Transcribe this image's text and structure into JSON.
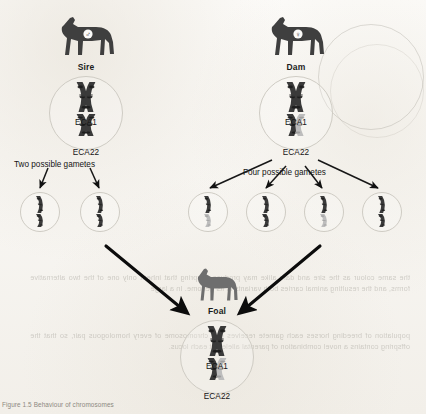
{
  "figure": {
    "caption": "Figure 1.5  Behaviour of chromosomes",
    "background_color": "#fbfaf8",
    "ink_color": "#3b3b3b",
    "arrow_color": "#111111",
    "nucleus_stroke": "#cfccc4"
  },
  "parents": [
    {
      "id": "sire",
      "label": "Sire",
      "sex_symbol": "♂",
      "sex_name": "male-symbol",
      "horse_color": "#3f3f3f",
      "chromosomes": [
        {
          "name": "ECA1",
          "left_color": "dark",
          "right_color": "dark"
        },
        {
          "name": "ECA22",
          "left_color": "dark",
          "right_color": "dark"
        }
      ],
      "gamete_caption": "Two possible gametes",
      "gamete_count": 2
    },
    {
      "id": "dam",
      "label": "Dam",
      "sex_symbol": "♀",
      "sex_name": "female-symbol",
      "horse_color": "#3f3f3f",
      "chromosomes": [
        {
          "name": "ECA1",
          "left_color": "dark",
          "right_color": "dark"
        },
        {
          "name": "ECA22",
          "left_color": "dark",
          "right_color": "light"
        }
      ],
      "gamete_caption": "Four possible gametes",
      "gamete_count": 4
    }
  ],
  "sire_gametes": [
    {
      "index": 1,
      "eca1": "dark",
      "eca22": "dark",
      "selected": false
    },
    {
      "index": 2,
      "eca1": "dark",
      "eca22": "dark",
      "selected": true
    }
  ],
  "dam_gametes": [
    {
      "index": 1,
      "eca1": "dark",
      "eca22": "light",
      "selected": false
    },
    {
      "index": 2,
      "eca1": "dark",
      "eca22": "dark",
      "selected": false
    },
    {
      "index": 3,
      "eca1": "dark",
      "eca22": "light",
      "selected": true
    },
    {
      "index": 4,
      "eca1": "dark",
      "eca22": "dark",
      "selected": false
    }
  ],
  "offspring": {
    "id": "foal",
    "label": "Foal",
    "horse_color": "#6e6e6e",
    "chromosomes": [
      {
        "name": "ECA1",
        "left_color": "dark",
        "right_color": "dark"
      },
      {
        "name": "ECA22",
        "left_color": "dark",
        "right_color": "light"
      }
    ]
  },
  "chromatid_palette": {
    "dark": "#3a3a3a",
    "light": "#bdbdbd",
    "band_dark": "#1a1a1a",
    "band_light": "#9a9a9a"
  },
  "ghost_text": {
    "line_a": "the same colour as the sire and dam alike may produce offspring that inherit only one of the two alternative forms, and the resulting animal carries both variants in its genome. In a large",
    "line_b": "population of breeding horses each gamete receives one chromosome of every homologous pair, so that the offspring contains a novel combination of parental alleles at each locus."
  }
}
